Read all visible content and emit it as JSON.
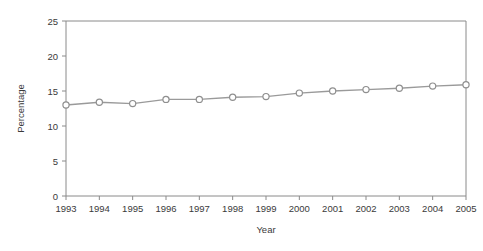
{
  "chart_data": {
    "type": "line",
    "title": "",
    "xlabel": "Year",
    "ylabel": "Percentage",
    "categories": [
      "1993",
      "1994",
      "1995",
      "1996",
      "1997",
      "1998",
      "1999",
      "2000",
      "2001",
      "2002",
      "2003",
      "2004",
      "2005"
    ],
    "x": [
      1993,
      1994,
      1995,
      1996,
      1997,
      1998,
      1999,
      2000,
      2001,
      2002,
      2003,
      2004,
      2005
    ],
    "values": [
      13.0,
      13.4,
      13.2,
      13.8,
      13.8,
      14.1,
      14.2,
      14.7,
      15.0,
      15.2,
      15.4,
      15.7,
      15.9
    ],
    "series": [
      {
        "name": "Percentage",
        "values": [
          13.0,
          13.4,
          13.2,
          13.8,
          13.8,
          14.1,
          14.2,
          14.7,
          15.0,
          15.2,
          15.4,
          15.7,
          15.9
        ]
      }
    ],
    "ylim": [
      0,
      25
    ],
    "yticks": [
      0,
      5,
      10,
      15,
      20,
      25
    ],
    "ytick_labels": [
      "0",
      "5",
      "10",
      "15",
      "20",
      "25"
    ],
    "xlim": [
      1993,
      2005
    ],
    "xticks": [
      1993,
      1994,
      1995,
      1996,
      1997,
      1998,
      1999,
      2000,
      2001,
      2002,
      2003,
      2004,
      2005
    ],
    "grid": false,
    "legend": false,
    "marker": "open-circle",
    "line_color": "#9a9a9a",
    "marker_fill": "#ffffff",
    "marker_edge_color": "#8f8f8f",
    "axis_color": "#8a8a8a",
    "text_color": "#3a3a3a",
    "background": "#ffffff"
  }
}
